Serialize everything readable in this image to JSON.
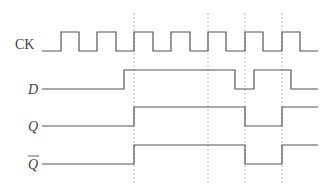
{
  "diagram": {
    "signals": [
      {
        "name": "CK",
        "label": "CK",
        "italic": false,
        "overline": false,
        "label_x": 15,
        "label_y": 49,
        "y_low": 51,
        "y_high": 32,
        "points": "42,51 61,51 61,32 79,32 79,51 97,51 97,32 116,32 116,51 134,51 134,32 153,32 153,51 171,51 171,32 190,32 190,51 208,51 208,32 226,32 226,51 245,51 245,32 263,32 263,51 282,51 282,32 300,32 300,51 318,51"
      },
      {
        "name": "D",
        "label": "D",
        "italic": true,
        "overline": false,
        "label_x": 28,
        "label_y": 94,
        "y_low": 89,
        "y_high": 70,
        "points": "42,89 124,89 124,70 235,70 235,89 254,89 254,70 291,70 291,89 318,89"
      },
      {
        "name": "Q",
        "label": "Q",
        "italic": true,
        "overline": false,
        "label_x": 28,
        "label_y": 131,
        "y_low": 126,
        "y_high": 107,
        "points": "42,126 134,126 134,107 245,107 245,126 282,126 282,107 318,107"
      },
      {
        "name": "Q-bar",
        "label": "Q",
        "italic": true,
        "overline": true,
        "label_x": 28,
        "label_y": 169,
        "y_low": 164,
        "y_high": 145,
        "points": "42,164 134,164 134,145 245,145 245,164 282,164 282,145 318,145"
      }
    ],
    "guides": [
      {
        "x": 134,
        "y1": 13,
        "y2": 184
      },
      {
        "x": 208,
        "y1": 13,
        "y2": 184
      },
      {
        "x": 245,
        "y1": 13,
        "y2": 184
      },
      {
        "x": 282,
        "y1": 13,
        "y2": 184
      }
    ],
    "colors": {
      "wave": "#555555",
      "guide": "#bbbbbb",
      "label": "#444444",
      "background": "#ffffff"
    }
  }
}
